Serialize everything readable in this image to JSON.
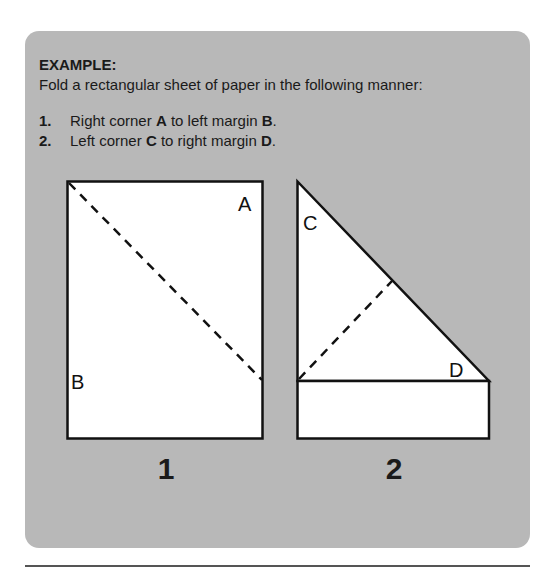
{
  "example": {
    "heading": "EXAMPLE:",
    "intro": "Fold a rectangular sheet of paper in the following manner:",
    "steps": [
      {
        "number": "1.",
        "pre": "Right corner ",
        "b1": "A",
        "mid": " to left margin ",
        "b2": "B",
        "post": "."
      },
      {
        "number": "2.",
        "pre": "Left corner ",
        "b1": "C",
        "mid": " to right margin ",
        "b2": "D",
        "post": "."
      }
    ]
  },
  "figures": [
    {
      "label": "1",
      "corners": {
        "A": "A",
        "B": "B"
      }
    },
    {
      "label": "2",
      "corners": {
        "C": "C",
        "D": "D"
      }
    }
  ],
  "colors": {
    "panel": "#b8b8b8",
    "paper": "#ffffff",
    "line": "#111111"
  }
}
